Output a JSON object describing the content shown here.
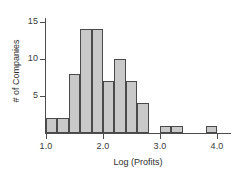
{
  "chart_data": {
    "type": "bar",
    "title": "",
    "subtitle": "",
    "xlabel": "Log (Profits)",
    "ylabel": "# of Companies",
    "xlim": [
      0.9,
      4.2
    ],
    "ylim": [
      0,
      15.5
    ],
    "grid": false,
    "legend": null,
    "bin_width": 0.2,
    "x_ticks": [
      "1.0",
      "2.0",
      "3.0",
      "4.0"
    ],
    "x_tick_values": [
      1.0,
      2.0,
      3.0,
      4.0
    ],
    "y_ticks": [
      "5",
      "10",
      "15"
    ],
    "y_tick_values": [
      5,
      10,
      15
    ],
    "bar_fill_color": "#c9c9c9",
    "bar_edge_color": "#4a4a4a",
    "axis_color": "#4d4d4d",
    "bins": [
      {
        "x0": 1.0,
        "x1": 1.2,
        "count": 2
      },
      {
        "x0": 1.2,
        "x1": 1.4,
        "count": 2
      },
      {
        "x0": 1.4,
        "x1": 1.6,
        "count": 8
      },
      {
        "x0": 1.6,
        "x1": 1.8,
        "count": 14
      },
      {
        "x0": 1.8,
        "x1": 2.0,
        "count": 14
      },
      {
        "x0": 2.0,
        "x1": 2.2,
        "count": 7
      },
      {
        "x0": 2.2,
        "x1": 2.4,
        "count": 10
      },
      {
        "x0": 2.4,
        "x1": 2.6,
        "count": 7
      },
      {
        "x0": 2.6,
        "x1": 2.8,
        "count": 4
      },
      {
        "x0": 3.0,
        "x1": 3.2,
        "count": 1
      },
      {
        "x0": 3.2,
        "x1": 3.4,
        "count": 1
      },
      {
        "x0": 3.8,
        "x1": 4.0,
        "count": 1
      }
    ],
    "categories": [
      "1.0-1.2",
      "1.2-1.4",
      "1.4-1.6",
      "1.6-1.8",
      "1.8-2.0",
      "2.0-2.2",
      "2.2-2.4",
      "2.4-2.6",
      "2.6-2.8",
      "3.0-3.2",
      "3.2-3.4",
      "3.8-4.0"
    ],
    "values": [
      2,
      2,
      8,
      14,
      14,
      7,
      10,
      7,
      4,
      1,
      1,
      1
    ]
  },
  "axes": {
    "x_title": "Log (Profits)",
    "y_title": "# of Companies"
  }
}
